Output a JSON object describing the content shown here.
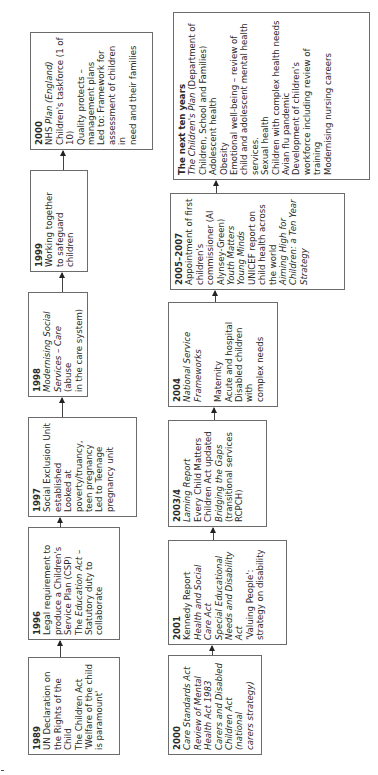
{
  "diagram": {
    "orientation": "rotated 90 degrees counter-clockwise (text reads bottom-to-top)",
    "top_row": [
      {
        "year": "1989",
        "lines": [
          {
            "text": "UN Declaration on",
            "italic": false
          },
          {
            "text": "the Rights of the",
            "italic": false
          },
          {
            "text": "Child",
            "italic": false
          },
          {
            "text": "The Children Act",
            "italic": false
          },
          {
            "text": "'Welfare of the child",
            "italic": false
          },
          {
            "text": "is paramount'",
            "italic": false
          }
        ]
      },
      {
        "year": "1996",
        "lines": [
          {
            "text": "Legal requirement to",
            "italic": false
          },
          {
            "text": "produce a Children's",
            "italic": false
          },
          {
            "text": "Service Plan (CSP)",
            "italic": false
          },
          {
            "text": "The Education Act –",
            "italic": true
          },
          {
            "text": "Statutory duty to",
            "italic": false
          },
          {
            "text": "collaborate",
            "italic": false
          }
        ]
      },
      {
        "year": "1997",
        "lines": [
          {
            "text": "Social Exclusion Unit",
            "italic": false
          },
          {
            "text": "established",
            "italic": false
          },
          {
            "text": "Looked at",
            "italic": false
          },
          {
            "text": "poverty/truancy,",
            "italic": false
          },
          {
            "text": "teen pregnancy",
            "italic": false
          },
          {
            "text": "Led to Teenage",
            "italic": false
          },
          {
            "text": "pregnancy unit",
            "italic": false
          }
        ]
      },
      {
        "year": "1998",
        "lines": [
          {
            "text": "Modernising Social",
            "italic": true
          },
          {
            "text": "Services – Care (abuse",
            "italic": false
          },
          {
            "text": "in the care system)",
            "italic": false
          }
        ]
      },
      {
        "year": "1999",
        "lines": [
          {
            "text": "Working together",
            "italic": false
          },
          {
            "text": "to safeguard",
            "italic": false
          },
          {
            "text": "children",
            "italic": false
          }
        ]
      },
      {
        "year": "2000",
        "lines": [
          {
            "text": "NHS Plan (England)",
            "italic": false
          },
          {
            "text": "Children's taskforce (1 of",
            "italic": false
          },
          {
            "text": "10)",
            "italic": false
          },
          {
            "text": "Quality protects –",
            "italic": false
          },
          {
            "text": "management plans",
            "italic": false
          },
          {
            "text": "Led to: Framework for",
            "italic": false
          },
          {
            "text": "assessment of children in",
            "italic": false
          },
          {
            "text": "need and their families",
            "italic": false
          }
        ]
      }
    ],
    "bottom_row": [
      {
        "year": "2000",
        "lines": [
          {
            "text": "Care Standards Act",
            "italic": true
          },
          {
            "text": "Review of Mental",
            "italic": true
          },
          {
            "text": "Health Act 1983",
            "italic": true
          },
          {
            "text": "Carers and Disabled",
            "italic": true
          },
          {
            "text": "Children Act (national",
            "italic": true
          },
          {
            "text": "carers strategy)",
            "italic": true
          }
        ]
      },
      {
        "year": "2001",
        "lines": [
          {
            "text": "Kennedy Report",
            "italic": false
          },
          {
            "text": "Health and Social",
            "italic": true
          },
          {
            "text": "Care Act",
            "italic": true
          },
          {
            "text": "Special Educational",
            "italic": true
          },
          {
            "text": "Needs and Disability",
            "italic": true
          },
          {
            "text": "Act",
            "italic": true
          },
          {
            "text": "'Valuing People':",
            "italic": false
          },
          {
            "text": "strategy on disability",
            "italic": false
          }
        ]
      },
      {
        "year": "2003/4",
        "lines": [
          {
            "text": "Laming Report",
            "italic": true
          },
          {
            "text": "Every Child Matters",
            "italic": false
          },
          {
            "text": "Children Act updated",
            "italic": false
          },
          {
            "text": "Bridging the Gaps",
            "italic": true
          },
          {
            "text": "(transitional services",
            "italic": false
          },
          {
            "text": "RCPCH)",
            "italic": false
          }
        ]
      },
      {
        "year": "2004",
        "lines": [
          {
            "text": "National Service",
            "italic": true
          },
          {
            "text": "Frameworks",
            "italic": true
          },
          {
            "text": "",
            "italic": false
          },
          {
            "text": "Maternity",
            "italic": false
          },
          {
            "text": "Acute and hospital",
            "italic": false
          },
          {
            "text": "Disabled children with",
            "italic": false
          },
          {
            "text": "complex needs",
            "italic": false
          }
        ]
      },
      {
        "year": "2005–2007",
        "lines": [
          {
            "text": "Appointment of first",
            "italic": false
          },
          {
            "text": "children's",
            "italic": false
          },
          {
            "text": "commissioner (Al",
            "italic": false
          },
          {
            "text": "Alynsey-Green)",
            "italic": false
          },
          {
            "text": "Youth Matters",
            "italic": true
          },
          {
            "text": "Young Minds",
            "italic": true
          },
          {
            "text": "UNICEF report on",
            "italic": false
          },
          {
            "text": "child health across",
            "italic": false
          },
          {
            "text": "the world",
            "italic": false
          },
          {
            "text": "Aiming High for",
            "italic": true
          },
          {
            "text": "Children: a Ten Year",
            "italic": true
          },
          {
            "text": "Strategy",
            "italic": true
          }
        ]
      },
      {
        "year": "The next ten years",
        "lines": [
          {
            "text": "The Children's Plan (Department of",
            "italic": false
          },
          {
            "text": "Children, School and Families)",
            "italic": false
          },
          {
            "text": "Adolescent health",
            "italic": false
          },
          {
            "text": "Obesity",
            "italic": false
          },
          {
            "text": "Emotional well-being – review of",
            "italic": false
          },
          {
            "text": "child and adolescent mental health",
            "italic": false
          },
          {
            "text": "services.",
            "italic": false
          },
          {
            "text": "Sexual health",
            "italic": false
          },
          {
            "text": "Children with complex health needs",
            "italic": false
          },
          {
            "text": "Avian flu pandemic",
            "italic": false
          },
          {
            "text": "Development of children's",
            "italic": false
          },
          {
            "text": "workforce including review of",
            "italic": false
          },
          {
            "text": "training",
            "italic": false
          },
          {
            "text": "Modernising nursing careers",
            "italic": false
          }
        ]
      }
    ]
  }
}
